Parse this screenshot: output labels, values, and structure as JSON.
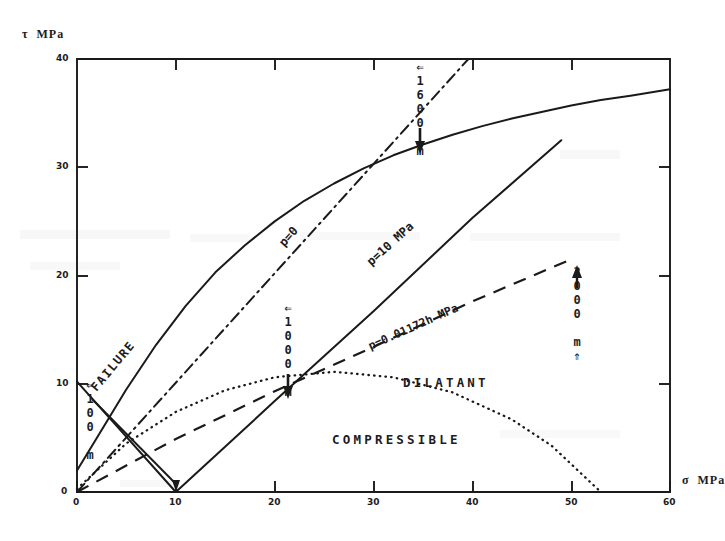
{
  "figure": {
    "background": "#ffffff",
    "ink_color": "#1a1a1a"
  },
  "axes": {
    "y_title": "τ  MPa",
    "x_title": "σ  MPa",
    "x_ticks": [
      "0",
      "10",
      "20",
      "30",
      "40",
      "50",
      "60"
    ],
    "y_ticks": [
      "0",
      "10",
      "20",
      "30",
      "40"
    ]
  },
  "labels": {
    "failure": "FAILURE",
    "p0": "p=0",
    "p10": "p=10 MPa",
    "p_grad": "p=0.01172h MPa",
    "dilatant": "DILATANT",
    "compressible": "COMPRESSIBLE",
    "depth_100": "⇐100 m",
    "depth_1000": "⇐1000 m",
    "depth_1600": "⇐1600 m",
    "depth_2000": "2000 m⇑"
  },
  "chart_data": {
    "type": "line",
    "title": "",
    "xlabel": "σ  MPa",
    "ylabel": "τ  MPa",
    "xlim": [
      0,
      60
    ],
    "ylim": [
      0,
      40
    ],
    "grid": false,
    "legend": "inline-curve-labels",
    "series": [
      {
        "name": "FAILURE",
        "style": "solid",
        "x": [
          0,
          2,
          5,
          8,
          11,
          14,
          17,
          20,
          23,
          26,
          29,
          32,
          35,
          38,
          41,
          44,
          47,
          50,
          53,
          56,
          60
        ],
        "y": [
          2.0,
          5.0,
          9.5,
          13.6,
          17.2,
          20.3,
          22.8,
          25.0,
          26.9,
          28.5,
          29.9,
          31.1,
          32.1,
          33.0,
          33.8,
          34.5,
          35.1,
          35.7,
          36.2,
          36.6,
          37.2
        ]
      },
      {
        "name": "p=0",
        "style": "dash-dot",
        "x": [
          0,
          39.6
        ],
        "y": [
          0,
          40
        ]
      },
      {
        "name": "p=10 MPa",
        "style": "solid",
        "x": [
          0,
          10,
          20,
          30,
          40,
          49
        ],
        "y": [
          10.2,
          0,
          8.4,
          16.7,
          25.3,
          32.5
        ]
      },
      {
        "name": "p=0.01172h MPa",
        "style": "dashed",
        "x": [
          0,
          10,
          20,
          30,
          40,
          50
        ],
        "y": [
          0,
          4.9,
          9.3,
          13.4,
          17.6,
          21.5
        ]
      },
      {
        "name": "dilatancy-boundary",
        "style": "dotted",
        "x": [
          0,
          5,
          10,
          15,
          20,
          26,
          32,
          38,
          44,
          48,
          53
        ],
        "y": [
          0.3,
          4.5,
          7.4,
          9.4,
          10.6,
          11.1,
          10.6,
          9.2,
          6.7,
          4.3,
          0
        ]
      }
    ],
    "annotations": [
      {
        "text": "⇐100 m",
        "x": 1.2,
        "y": 10.0,
        "orientation": "vertical"
      },
      {
        "text": "⇐1000 m",
        "x": 22.4,
        "y": 11.5,
        "orientation": "vertical"
      },
      {
        "text": "⇐1600 m",
        "x": 38.2,
        "y": 37.0,
        "orientation": "vertical"
      },
      {
        "text": "2000 m⇑",
        "x": 50.5,
        "y": 22.0,
        "orientation": "vertical"
      },
      {
        "text": "DILATANT",
        "x": 36.5,
        "y": 12.4,
        "orientation": "horizontal"
      },
      {
        "text": "COMPRESSIBLE",
        "x": 28.0,
        "y": 6.2,
        "orientation": "horizontal"
      },
      {
        "text": "FAILURE",
        "x": 3.0,
        "y": 13.5,
        "orientation": "rotated"
      },
      {
        "text": "p=0",
        "x": 22.0,
        "y": 21.5,
        "orientation": "rotated"
      },
      {
        "text": "p=10 MPa",
        "x": 31.0,
        "y": 21.0,
        "orientation": "rotated"
      },
      {
        "text": "p=0.01172h MPa",
        "x": 31.0,
        "y": 15.0,
        "orientation": "rotated"
      }
    ]
  }
}
